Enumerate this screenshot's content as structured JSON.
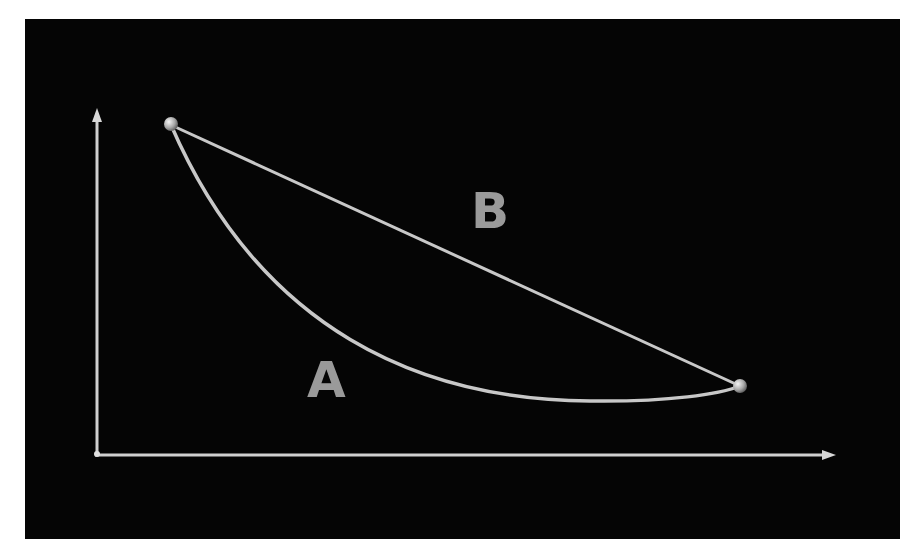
{
  "diagram": {
    "background": "#050505",
    "page_background": "#ffffff",
    "line_color": "#c8c8c8",
    "label_color": "#9a9a9a",
    "axes": {
      "x_axis": {
        "from": [
          95,
          455
        ],
        "to": [
          835,
          455
        ],
        "arrow": true
      },
      "y_axis": {
        "from": [
          97,
          455
        ],
        "to": [
          97,
          110
        ],
        "arrow": true
      }
    },
    "points": [
      {
        "name": "start",
        "x": 171,
        "y": 125
      },
      {
        "name": "end",
        "x": 740,
        "y": 386
      }
    ],
    "paths": {
      "B_straight": "straight line from start to end",
      "A_curve": "convex curve from start sagging down to ~y402 before rising to end"
    },
    "labels": {
      "A": "A",
      "B": "B"
    }
  }
}
